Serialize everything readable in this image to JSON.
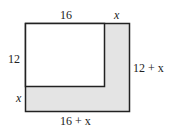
{
  "diagram": {
    "labels": {
      "top_inner": "16",
      "top_extension": "x",
      "left_inner": "12",
      "left_extension": "x",
      "right_outer": "12 + x",
      "bottom_outer": "16 + x"
    },
    "colors": {
      "shaded_region": "#e4e4e4",
      "inner_region": "#ffffff",
      "stroke": "#222222"
    }
  }
}
